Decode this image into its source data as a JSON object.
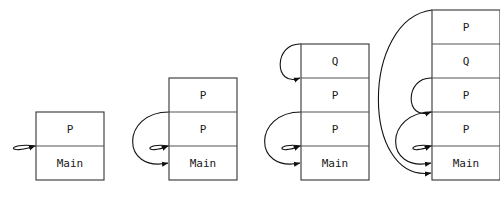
{
  "figure": {
    "type": "call-stack-diagram",
    "background_color": "#ffffff",
    "box_stroke_color": "#333333",
    "divider_stroke_color": "#555555",
    "arrow_color": "#111111",
    "text_color": "#1a1a1a",
    "canvas": {
      "width": 500,
      "height": 200
    }
  },
  "stacks": [
    {
      "id": "stack-1",
      "index": 1,
      "x": 36,
      "width": 68,
      "bottom_y": 180,
      "cell_height": 34,
      "frames": [
        {
          "label": "P"
        },
        {
          "label": "Main"
        }
      ],
      "arrows": [
        {
          "from_y": 146,
          "to_y": 146,
          "bulge": 26
        }
      ]
    },
    {
      "id": "stack-2",
      "index": 2,
      "x": 169,
      "width": 68,
      "bottom_y": 180,
      "cell_height": 34,
      "frames": [
        {
          "label": "P"
        },
        {
          "label": "P"
        },
        {
          "label": "Main"
        }
      ],
      "arrows": [
        {
          "from_y": 112,
          "to_y": 163,
          "bulge": 42
        },
        {
          "from_y": 146,
          "to_y": 146,
          "bulge": 22
        }
      ]
    },
    {
      "id": "stack-3",
      "index": 3,
      "x": 301,
      "width": 68,
      "bottom_y": 180,
      "cell_height": 34,
      "frames": [
        {
          "label": "Q"
        },
        {
          "label": "P"
        },
        {
          "label": "P"
        },
        {
          "label": "Main"
        }
      ],
      "arrows": [
        {
          "from_y": 44,
          "to_y": 78,
          "bulge": 24
        },
        {
          "from_y": 112,
          "to_y": 163,
          "bulge": 42
        },
        {
          "from_y": 146,
          "to_y": 146,
          "bulge": 22
        }
      ]
    },
    {
      "id": "stack-4",
      "index": 4,
      "x": 432,
      "width": 68,
      "bottom_y": 180,
      "cell_height": 34,
      "frames": [
        {
          "label": "P"
        },
        {
          "label": "Q"
        },
        {
          "label": "P"
        },
        {
          "label": "P"
        },
        {
          "label": "Main"
        }
      ],
      "arrows": [
        {
          "from_y": 10,
          "to_y": 173,
          "bulge": 62
        },
        {
          "from_y": 78,
          "to_y": 112,
          "bulge": 24
        },
        {
          "from_y": 112,
          "to_y": 163,
          "bulge": 42
        },
        {
          "from_y": 146,
          "to_y": 146,
          "bulge": 22
        }
      ]
    }
  ],
  "chart_data": {
    "type": "diagram",
    "title": "",
    "snapshots": [
      {
        "step": 1,
        "frames_top_to_bottom": [
          "P",
          "Main"
        ],
        "arrow_count": 1
      },
      {
        "step": 2,
        "frames_top_to_bottom": [
          "P",
          "P",
          "Main"
        ],
        "arrow_count": 2
      },
      {
        "step": 3,
        "frames_top_to_bottom": [
          "Q",
          "P",
          "P",
          "Main"
        ],
        "arrow_count": 3
      },
      {
        "step": 4,
        "frames_top_to_bottom": [
          "P",
          "Q",
          "P",
          "P",
          "Main"
        ],
        "arrow_count": 4
      }
    ]
  }
}
